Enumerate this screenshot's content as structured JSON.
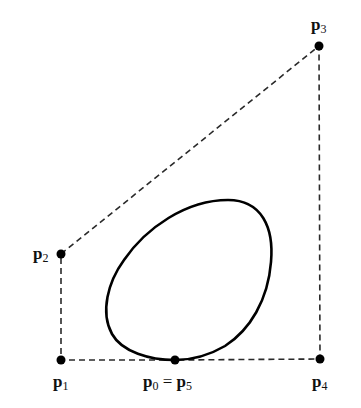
{
  "diagram": {
    "control_points": [
      {
        "id": "p0",
        "x": 175,
        "y": 360
      },
      {
        "id": "p1",
        "x": 61,
        "y": 360
      },
      {
        "id": "p2",
        "x": 61,
        "y": 254
      },
      {
        "id": "p3",
        "x": 319,
        "y": 46
      },
      {
        "id": "p4",
        "x": 320,
        "y": 359
      },
      {
        "id": "p5",
        "x": 175,
        "y": 360
      }
    ],
    "labels": {
      "p1": {
        "base": "p",
        "sub": "1"
      },
      "p2": {
        "base": "p",
        "sub": "2"
      },
      "p3": {
        "base": "p",
        "sub": "3"
      },
      "p4": {
        "base": "p",
        "sub": "4"
      },
      "p0": {
        "base": "p",
        "sub": "0",
        "eq": " = ",
        "base2": "p",
        "sub2": "5"
      }
    },
    "colors": {
      "curve": "#000000",
      "polygon": "#2a2a2a",
      "points": "#000000"
    }
  }
}
